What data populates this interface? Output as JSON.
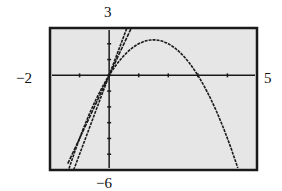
{
  "chart_data": {
    "type": "line",
    "title": "",
    "window": {
      "xmin": -2,
      "xmax": 5,
      "ymin": -6,
      "ymax": 3
    },
    "xlabel": "",
    "ylabel": "",
    "tick_labels": {
      "left": "−2",
      "right": "5",
      "top": "3",
      "bottom": "−6"
    },
    "xticks": [
      -2,
      -1,
      0,
      1,
      2,
      3,
      4,
      5
    ],
    "yticks": [
      -6,
      -5,
      -4,
      -3,
      -2,
      -1,
      0,
      1,
      2,
      3
    ],
    "grid": false,
    "series": [
      {
        "name": "parabola",
        "expression": "y = -x^2 + 3x",
        "x": [
          -1,
          -0.5,
          0,
          0.5,
          1,
          1.5,
          2,
          2.5,
          3,
          3.5,
          4,
          4.3
        ],
        "y": [
          -4,
          -1.75,
          0,
          1.25,
          2,
          2.25,
          2,
          1.25,
          0,
          -1.75,
          -4,
          -5.59
        ]
      },
      {
        "name": "line-1",
        "expression": "y = 4x",
        "x": [
          -1.4,
          0.75
        ],
        "y": [
          -5.6,
          3
        ]
      },
      {
        "name": "line-2",
        "expression": "y = 5x",
        "x": [
          -1.2,
          0.6
        ],
        "y": [
          -6,
          3
        ]
      }
    ]
  },
  "labels": {
    "top": "3",
    "bottom": "−6",
    "left": "−2",
    "right": "5"
  },
  "colors": {
    "screen": "#e6e6e6",
    "frame": "#1a1a1a",
    "plot": "#1a1a1a"
  }
}
